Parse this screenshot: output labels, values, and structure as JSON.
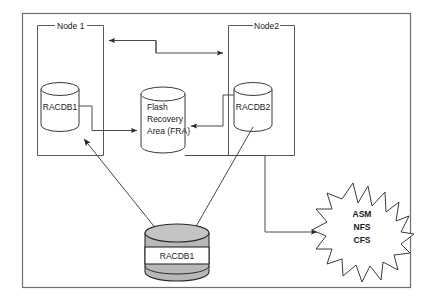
{
  "diagram": {
    "frame": {
      "stroke": "#6e6e6e"
    },
    "nodes": [
      {
        "id": "node1",
        "label": "Node 1"
      },
      {
        "id": "node2",
        "label": "Node2"
      }
    ],
    "databases": [
      {
        "id": "racdb1-node1",
        "label": "RACDB1",
        "style": "outline"
      },
      {
        "id": "racdb2-node2",
        "label": "RACDB2",
        "style": "outline"
      },
      {
        "id": "racdb1-shared",
        "label": "RACDB1",
        "style": "shaded"
      }
    ],
    "fra": {
      "id": "flash-recovery-area",
      "line1": "Flash",
      "line2": "Recovery",
      "line3": "Area  (FRA)"
    },
    "storage_burst": {
      "id": "storage-options",
      "line1": "ASM",
      "line2": "NFS",
      "line3": "CFS"
    },
    "colors": {
      "frame_stroke": "#6e6e6e",
      "box_stroke": "#5a5a5a",
      "connector": "#4a4a4a",
      "cylinder_stroke": "#3a3a3a",
      "shaded_fill": "#b8b8b8",
      "shaded_top": "#c4c4c4",
      "text": "#1a1a1a",
      "background": "#ffffff"
    }
  }
}
